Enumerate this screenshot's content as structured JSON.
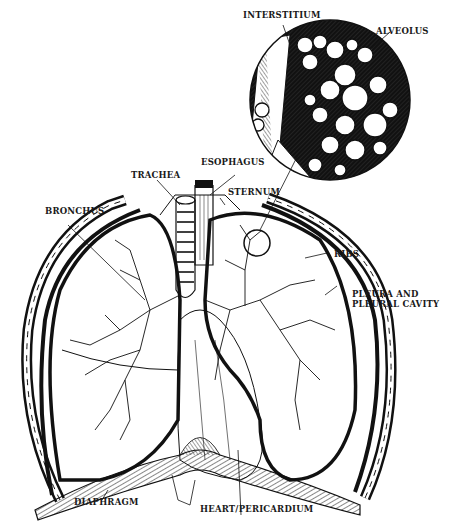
{
  "diagram": {
    "ink_color": "#111111",
    "background": "#ffffff",
    "labels": [
      {
        "id": "interstitium",
        "text": "INTERSTITIUM"
      },
      {
        "id": "alveolus",
        "text": "ALVEOLUS"
      },
      {
        "id": "esophagus",
        "text": "ESOPHAGUS"
      },
      {
        "id": "trachea",
        "text": "TRACHEA"
      },
      {
        "id": "sternum",
        "text": "STERNUM"
      },
      {
        "id": "bronchus",
        "text": "BRONCHUS"
      },
      {
        "id": "ribs",
        "text": "RIBS"
      },
      {
        "id": "pleura_line1",
        "text": "PLEURA AND"
      },
      {
        "id": "pleura_line2",
        "text": "PLEURAL CAVITY"
      },
      {
        "id": "diaphragm",
        "text": "DIAPHRAGM"
      },
      {
        "id": "heart",
        "text": "HEART/PERICARDIUM"
      }
    ]
  }
}
